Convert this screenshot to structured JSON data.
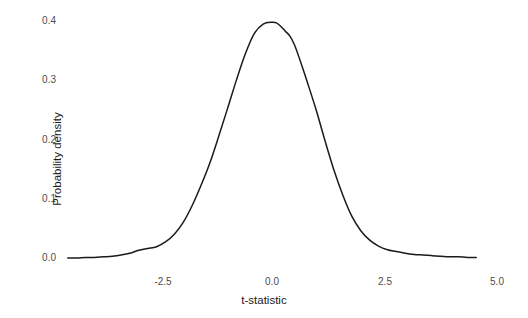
{
  "figure": {
    "background_color": "#ffffff",
    "line_color": "#1a1a1a",
    "tick_label_color": "#4d4d4d",
    "axis_title_color": "#1a1a1a"
  },
  "chart_data": {
    "type": "line",
    "title": "",
    "subtitle": "",
    "xlabel": "t-statistic",
    "ylabel": "Probability density",
    "xlim": [
      -5.0,
      5.0
    ],
    "ylim": [
      0.0,
      0.4
    ],
    "xticks": [
      -2.5,
      0.0,
      2.5,
      5.0
    ],
    "xtick_labels": [
      "-2.5",
      "0.0",
      "2.5",
      "5.0"
    ],
    "yticks": [
      0.0,
      0.1,
      0.2,
      0.3,
      0.4
    ],
    "ytick_labels": [
      "0.0",
      "0.1",
      "0.2",
      "0.3",
      "0.4"
    ],
    "grid": false,
    "legend": false,
    "legend_position": "none",
    "annotations": [],
    "series": [
      {
        "name": "t-statistic density",
        "color": "#1a1a1a",
        "line_width": 1.5,
        "x": [
          -4.6,
          -4.4,
          -4.2,
          -4.0,
          -3.8,
          -3.6,
          -3.4,
          -3.2,
          -3.0,
          -2.8,
          -2.6,
          -2.4,
          -2.2,
          -2.0,
          -1.8,
          -1.6,
          -1.4,
          -1.2,
          -1.0,
          -0.8,
          -0.6,
          -0.4,
          -0.2,
          0.0,
          0.1,
          0.2,
          0.3,
          0.4,
          0.5,
          0.6,
          0.8,
          1.0,
          1.2,
          1.4,
          1.6,
          1.8,
          2.0,
          2.2,
          2.4,
          2.6,
          2.8,
          3.0,
          3.2,
          3.4,
          3.6,
          3.8,
          4.0,
          4.2,
          4.4,
          4.6
        ],
        "y": [
          0.0,
          0.0,
          0.001,
          0.001,
          0.002,
          0.003,
          0.005,
          0.008,
          0.013,
          0.016,
          0.019,
          0.027,
          0.04,
          0.06,
          0.088,
          0.122,
          0.16,
          0.205,
          0.252,
          0.3,
          0.344,
          0.378,
          0.394,
          0.397,
          0.396,
          0.39,
          0.382,
          0.374,
          0.36,
          0.34,
          0.295,
          0.248,
          0.196,
          0.147,
          0.105,
          0.07,
          0.046,
          0.03,
          0.02,
          0.014,
          0.011,
          0.008,
          0.006,
          0.005,
          0.004,
          0.003,
          0.002,
          0.002,
          0.001,
          0.001
        ]
      }
    ]
  },
  "axes_pixels": {
    "x_of_neg2_5": 163,
    "x_of_0": 272,
    "x_of_2_5": 385,
    "x_of_5": 497,
    "y_of_0_0": 258,
    "y_of_0_4": 20.5
  }
}
